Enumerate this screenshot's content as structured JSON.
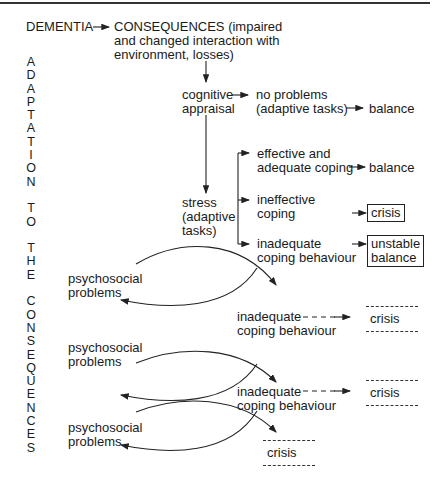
{
  "diagram": {
    "root": "DEMENTIA",
    "consequences": [
      "CONSEQUENCES (impaired",
      "and changed interaction with",
      "environment, losses)"
    ],
    "vertical_label": "ADAPTATION TO THE CONSEQUENCES",
    "vertical_letters": [
      "A",
      "D",
      "A",
      "P",
      "T",
      "A",
      "T",
      "I",
      "O",
      "N",
      "",
      "T",
      "O",
      "",
      "T",
      "H",
      "E",
      "",
      "C",
      "O",
      "N",
      "S",
      "E",
      "Q",
      "U",
      "E",
      "N",
      "C",
      "E",
      "S"
    ],
    "cognitive": [
      "cognitive",
      "appraisal"
    ],
    "no_problems": [
      "no problems",
      "(adaptive tasks)"
    ],
    "balance_1": "balance",
    "stress": [
      "stress",
      "(adaptive",
      "tasks)"
    ],
    "effective": [
      "effective and",
      "adequate coping"
    ],
    "balance_2": "balance",
    "ineffective": [
      "ineffective",
      "coping"
    ],
    "crisis_boxed": "crisis",
    "inadequate_1": [
      "inadequate",
      "coping behaviour"
    ],
    "unstable": [
      "unstable",
      "balance"
    ],
    "psychosocial_1": [
      "psychosocial",
      "problems"
    ],
    "inadequate_2": [
      "inadequate",
      "coping behaviour"
    ],
    "crisis_2": "crisis",
    "psychosocial_2": [
      "psychosocial",
      "problems"
    ],
    "inadequate_3": [
      "inadequate",
      "coping behaviour"
    ],
    "crisis_3": "crisis",
    "psychosocial_3": [
      "psychosocial",
      "problems"
    ],
    "crisis_4": "crisis"
  }
}
